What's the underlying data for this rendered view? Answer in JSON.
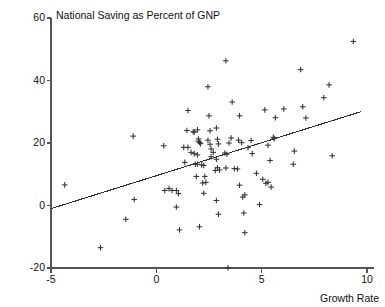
{
  "chart_data": {
    "type": "scatter",
    "title": "National Saving as Percent of GNP",
    "xlabel": "Growth Rate",
    "ylabel": "",
    "xlim": [
      -5,
      10
    ],
    "ylim": [
      -20,
      60
    ],
    "grid": false,
    "legend": null,
    "marker": "plus",
    "marker_color": "#333333",
    "axis_color": "#555555",
    "xticks": [
      -5,
      0,
      5,
      10
    ],
    "xtick_labels": [
      "-5",
      "0",
      "5",
      "10"
    ],
    "yticks": [
      -20,
      0,
      20,
      40,
      60
    ],
    "ytick_labels": [
      "-20",
      "0",
      "20",
      "40",
      "60"
    ],
    "trendline": {
      "name": "regression line",
      "x": [
        -5,
        9.7
      ],
      "y": [
        -1.0,
        30.0
      ],
      "color": "#333333"
    },
    "points": [
      {
        "x": -4.35,
        "y": 6.6
      },
      {
        "x": -2.65,
        "y": -13.5
      },
      {
        "x": -1.1,
        "y": 22.2
      },
      {
        "x": -1.05,
        "y": 1.9
      },
      {
        "x": -1.45,
        "y": -4.4
      },
      {
        "x": 0.35,
        "y": 19.1
      },
      {
        "x": 0.4,
        "y": 4.8
      },
      {
        "x": 0.6,
        "y": 5.4
      },
      {
        "x": 0.75,
        "y": 4.8
      },
      {
        "x": 0.95,
        "y": 4.8
      },
      {
        "x": 1.05,
        "y": 3.8
      },
      {
        "x": 0.95,
        "y": -0.5
      },
      {
        "x": 1.1,
        "y": -7.8
      },
      {
        "x": 1.3,
        "y": 18.6
      },
      {
        "x": 1.5,
        "y": 18.6
      },
      {
        "x": 1.35,
        "y": 13.8
      },
      {
        "x": 1.5,
        "y": 30.4
      },
      {
        "x": 1.45,
        "y": 24.0
      },
      {
        "x": 1.75,
        "y": 23.6
      },
      {
        "x": 1.65,
        "y": 17.0
      },
      {
        "x": 1.8,
        "y": 16.6
      },
      {
        "x": 1.95,
        "y": 16.2
      },
      {
        "x": 1.85,
        "y": 13.2
      },
      {
        "x": 1.95,
        "y": 13.2
      },
      {
        "x": 1.8,
        "y": 23.5
      },
      {
        "x": 1.95,
        "y": 24.2
      },
      {
        "x": 2.0,
        "y": 21.3
      },
      {
        "x": 2.05,
        "y": 20.2
      },
      {
        "x": 2.1,
        "y": 19.8
      },
      {
        "x": 2.0,
        "y": 20.6
      },
      {
        "x": 2.15,
        "y": 13.0
      },
      {
        "x": 2.25,
        "y": 12.8
      },
      {
        "x": 2.3,
        "y": 9.3
      },
      {
        "x": 1.9,
        "y": 9.3
      },
      {
        "x": 2.2,
        "y": 7.2
      },
      {
        "x": 2.35,
        "y": 7.4
      },
      {
        "x": 2.25,
        "y": 3.9
      },
      {
        "x": 2.05,
        "y": -6.8
      },
      {
        "x": 2.55,
        "y": 23.9
      },
      {
        "x": 2.45,
        "y": 20.9
      },
      {
        "x": 2.55,
        "y": 19.6
      },
      {
        "x": 2.6,
        "y": 18.1
      },
      {
        "x": 2.7,
        "y": 17.0
      },
      {
        "x": 2.6,
        "y": 15.6
      },
      {
        "x": 2.5,
        "y": 28.7
      },
      {
        "x": 2.45,
        "y": 38.0
      },
      {
        "x": 2.85,
        "y": 24.8
      },
      {
        "x": 2.9,
        "y": 21.2
      },
      {
        "x": 2.95,
        "y": 19.7
      },
      {
        "x": 2.85,
        "y": 14.8
      },
      {
        "x": 2.9,
        "y": 12.1
      },
      {
        "x": 2.8,
        "y": 11.2
      },
      {
        "x": 3.0,
        "y": 11.4
      },
      {
        "x": 2.85,
        "y": 1.6
      },
      {
        "x": 2.95,
        "y": -2.8
      },
      {
        "x": 3.3,
        "y": 46.3
      },
      {
        "x": 3.25,
        "y": 16.8
      },
      {
        "x": 3.35,
        "y": 16.4
      },
      {
        "x": 3.45,
        "y": 20.0
      },
      {
        "x": 3.3,
        "y": 12.0
      },
      {
        "x": 3.4,
        "y": -19.9
      },
      {
        "x": 3.6,
        "y": 33.1
      },
      {
        "x": 3.55,
        "y": 21.6
      },
      {
        "x": 3.7,
        "y": 11.8
      },
      {
        "x": 3.85,
        "y": 11.7
      },
      {
        "x": 3.95,
        "y": 28.7
      },
      {
        "x": 3.9,
        "y": 20.9
      },
      {
        "x": 4.05,
        "y": 20.1
      },
      {
        "x": 3.95,
        "y": 6.5
      },
      {
        "x": 4.1,
        "y": 2.7
      },
      {
        "x": 4.2,
        "y": 3.4
      },
      {
        "x": 4.15,
        "y": -2.4
      },
      {
        "x": 4.2,
        "y": -8.7
      },
      {
        "x": 4.35,
        "y": 18.5
      },
      {
        "x": 4.5,
        "y": 20.8
      },
      {
        "x": 4.55,
        "y": 16.6
      },
      {
        "x": 4.75,
        "y": 10.3
      },
      {
        "x": 4.9,
        "y": 0.3
      },
      {
        "x": 5.05,
        "y": 8.4
      },
      {
        "x": 5.2,
        "y": 7.1
      },
      {
        "x": 5.3,
        "y": 7.4
      },
      {
        "x": 5.15,
        "y": 30.6
      },
      {
        "x": 5.3,
        "y": 19.3
      },
      {
        "x": 5.45,
        "y": 5.9
      },
      {
        "x": 5.55,
        "y": 21.8
      },
      {
        "x": 5.6,
        "y": 21.4
      },
      {
        "x": 5.4,
        "y": 14.4
      },
      {
        "x": 5.65,
        "y": 28.1
      },
      {
        "x": 6.05,
        "y": 30.9
      },
      {
        "x": 6.5,
        "y": 13.2
      },
      {
        "x": 6.55,
        "y": 17.4
      },
      {
        "x": 6.85,
        "y": 43.5
      },
      {
        "x": 6.95,
        "y": 31.6
      },
      {
        "x": 7.1,
        "y": 28.0
      },
      {
        "x": 7.95,
        "y": 34.5
      },
      {
        "x": 8.2,
        "y": 38.6
      },
      {
        "x": 8.35,
        "y": 15.9
      },
      {
        "x": 9.35,
        "y": 52.5
      }
    ]
  }
}
